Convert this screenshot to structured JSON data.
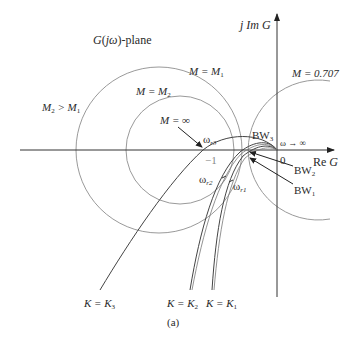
{
  "diagram": {
    "plane_label": "G(jω)-plane",
    "axes": {
      "imag_label": "j Im G",
      "real_label": "Re G",
      "origin_label": "0",
      "minus_one_label": "−1"
    },
    "circles": [
      {
        "label": "M = M1",
        "sub": "1"
      },
      {
        "label": "M = M2",
        "sub": "2"
      },
      {
        "label": "M = 0.707"
      }
    ],
    "annotations": {
      "m_relation": "M2 > M1",
      "m_infinity": "M = ∞",
      "omega_infinity": "ω → ∞",
      "omega_r3": "ωr3",
      "omega_r2": "ωr2",
      "omega_r1": "ωr1",
      "bw3": "BW3",
      "bw2": "BW2",
      "bw1": "BW1"
    },
    "curves": [
      {
        "label": "K = K3"
      },
      {
        "label": "K = K2"
      },
      {
        "label": "K = K1"
      }
    ],
    "caption": "(a)",
    "colors": {
      "axis": "#333333",
      "circle": "#9a9a9a",
      "curve": "#444444",
      "text": "#2a2a2a"
    }
  }
}
